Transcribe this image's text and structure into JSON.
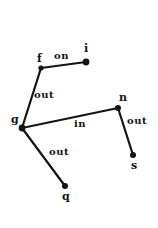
{
  "diagram": {
    "type": "node-link-graph",
    "background_color": "#ffffff",
    "ink_color": "#141414",
    "nodes": [
      {
        "id": "f",
        "label": "f",
        "x": 41,
        "y": 68,
        "label_x": 37,
        "label_y": 53,
        "radius": 2.6
      },
      {
        "id": "i",
        "label": "i",
        "x": 86,
        "y": 62,
        "label_x": 84,
        "label_y": 43,
        "radius": 3.4
      },
      {
        "id": "g",
        "label": "g",
        "x": 22,
        "y": 128,
        "label_x": 11,
        "label_y": 114,
        "radius": 3.4
      },
      {
        "id": "n",
        "label": "n",
        "x": 118,
        "y": 108,
        "label_x": 119,
        "label_y": 92,
        "radius": 3.0
      },
      {
        "id": "s",
        "label": "s",
        "x": 133,
        "y": 155,
        "label_x": 131,
        "label_y": 160,
        "radius": 3.0
      },
      {
        "id": "q",
        "label": "q",
        "x": 65,
        "y": 186,
        "label_x": 62,
        "label_y": 191,
        "radius": 3.0
      }
    ],
    "edges": [
      {
        "id": "f-i",
        "from": "f",
        "to": "i",
        "label": "on",
        "label_x": 54,
        "label_y": 51,
        "width": 2.2
      },
      {
        "id": "g-f",
        "from": "g",
        "to": "f",
        "label": "out",
        "label_x": 34,
        "label_y": 90,
        "width": 2.2
      },
      {
        "id": "g-n",
        "from": "g",
        "to": "n",
        "label": "in",
        "label_x": 74,
        "label_y": 119,
        "width": 2.2
      },
      {
        "id": "n-s",
        "from": "n",
        "to": "s",
        "label": "out",
        "label_x": 127,
        "label_y": 116,
        "width": 2.2
      },
      {
        "id": "g-q",
        "from": "g",
        "to": "q",
        "label": "out",
        "label_x": 49,
        "label_y": 147,
        "width": 2.2
      }
    ]
  }
}
